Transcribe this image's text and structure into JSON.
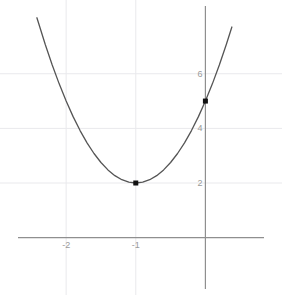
{
  "chart_data": {
    "type": "line",
    "title": "",
    "subtitle": "",
    "xlabel": "",
    "ylabel": "",
    "equation": "y = 3(x + 1)^2 + 2",
    "curve": {
      "name": "parabola",
      "vertex_form": {
        "a": 3,
        "h": -1,
        "k": 2
      },
      "color": "#555555",
      "x": [
        -2.42,
        -2.3,
        -2.2,
        -2.1,
        -2.0,
        -1.9,
        -1.8,
        -1.7,
        -1.6,
        -1.5,
        -1.4,
        -1.3,
        -1.2,
        -1.1,
        -1.0,
        -0.9,
        -0.8,
        -0.7,
        -0.6,
        -0.5,
        -0.4,
        -0.3,
        -0.2,
        -0.1,
        0.0,
        0.1,
        0.2,
        0.3,
        0.38
      ],
      "y": [
        8.05,
        7.07,
        6.32,
        5.63,
        5.0,
        4.43,
        3.92,
        3.47,
        3.08,
        2.75,
        2.48,
        2.27,
        2.12,
        2.03,
        2.0,
        2.03,
        2.12,
        2.27,
        2.48,
        2.75,
        3.08,
        3.47,
        3.92,
        4.43,
        5.0,
        5.63,
        6.32,
        7.07,
        7.71
      ]
    },
    "points": [
      {
        "label": "vertex",
        "x": -1,
        "y": 2,
        "color": "#111111"
      },
      {
        "label": "y-intercept",
        "x": 0,
        "y": 5,
        "color": "#111111"
      }
    ],
    "xaxis": {
      "ticks": [
        -2,
        -1
      ],
      "tick_labels": [
        "-2",
        "-1"
      ],
      "range": [
        -2.95,
        1.1
      ],
      "axis_color": "#8f8f8f"
    },
    "yaxis": {
      "ticks": [
        2,
        4,
        6
      ],
      "tick_labels": [
        "2",
        "4",
        "6"
      ],
      "range": [
        -2.1,
        8.7
      ],
      "axis_color": "#8f8f8f"
    },
    "grid": {
      "visible": true,
      "color": "#e9e9ec",
      "x_lines": [
        -2,
        -1
      ],
      "y_lines": [
        2,
        4,
        6
      ]
    },
    "legend": {
      "visible": false,
      "position": "none"
    }
  }
}
